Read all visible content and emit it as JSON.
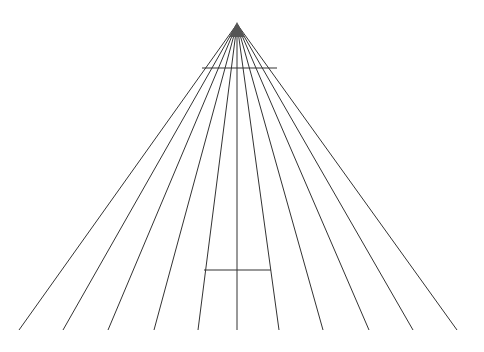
{
  "diagram": {
    "width": 484,
    "height": 352,
    "background": "#ffffff",
    "line_color": "#333333",
    "apex": {
      "x": 237,
      "y": 24
    },
    "apex_triangle": {
      "points": "237,22 229,37 245,37",
      "fill": "#555555"
    },
    "rays_bottom_y": 330,
    "rays_bottom_x": [
      19,
      63,
      108,
      154,
      198,
      237,
      279,
      323,
      369,
      413,
      457
    ],
    "upper_bar": {
      "x1": 202,
      "y1": 68,
      "x2": 277,
      "y2": 68
    },
    "lower_bar": {
      "x1": 204,
      "y1": 270,
      "x2": 271,
      "y2": 270
    }
  }
}
